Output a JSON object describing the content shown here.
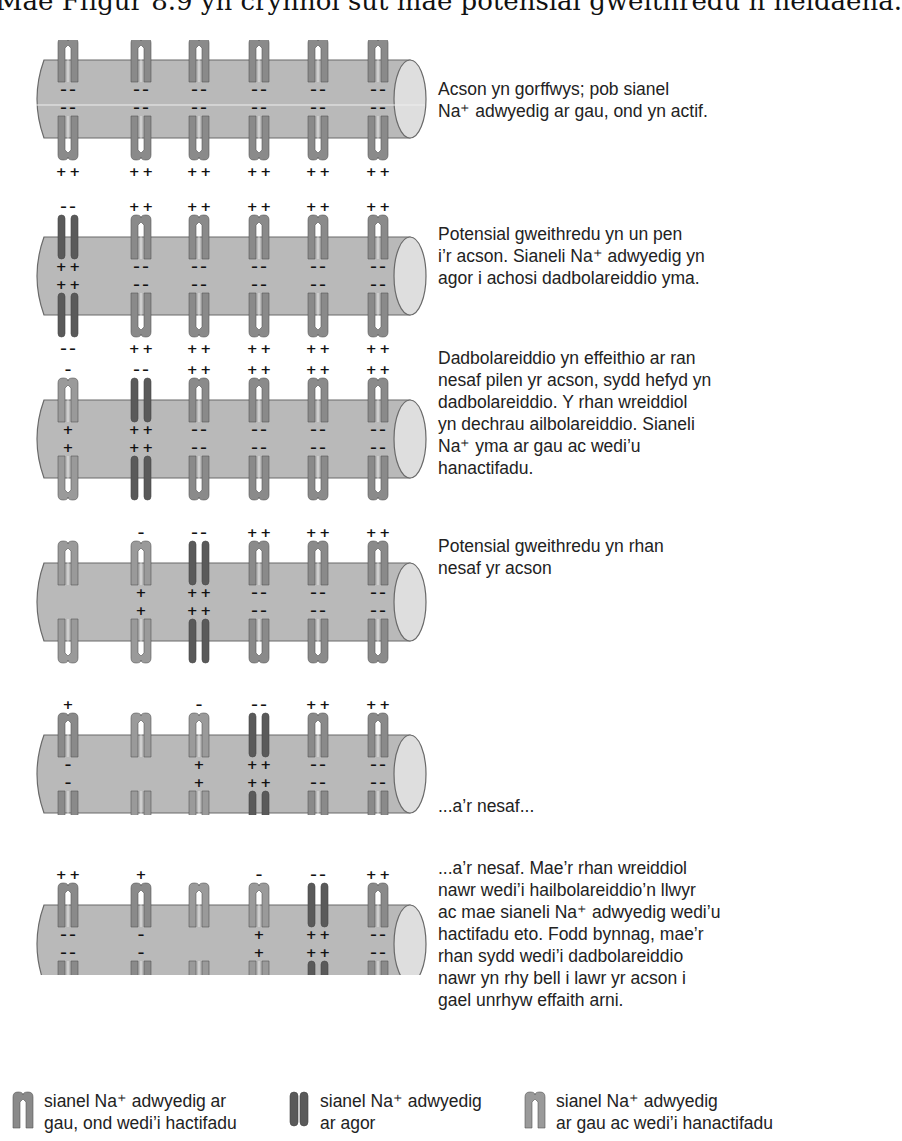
{
  "title": "Mae Ffigur 8.9 yn crynhoi sut mae potensial gweithredu n neidaena.",
  "colors": {
    "axon_fill": "#b9b9b9",
    "axon_end": "#dedede",
    "axon_outline": "#6a6a6a",
    "channel_closed_active": "#8a8a8a",
    "channel_open": "#5a5a5a",
    "channel_inactivated": "#9a9a9a"
  },
  "panels": [
    {
      "caption_lines": [
        "Acson yn gorffwys; pob sianel",
        "Na⁺ adwyedig ar gau, ond yn actif."
      ],
      "channels": [
        {
          "state": "closed",
          "top_out": "+ +",
          "top_in": "– –",
          "bot_in": "– –",
          "bot_out": "+ +"
        },
        {
          "state": "closed",
          "top_out": "+ +",
          "top_in": "– –",
          "bot_in": "– –",
          "bot_out": "+ +"
        },
        {
          "state": "closed",
          "top_out": "+ +",
          "top_in": "– –",
          "bot_in": "– –",
          "bot_out": "+ +"
        },
        {
          "state": "closed",
          "top_out": "+ +",
          "top_in": "– –",
          "bot_in": "– –",
          "bot_out": "+ +"
        },
        {
          "state": "closed",
          "top_out": "+ +",
          "top_in": "– –",
          "bot_in": "– –",
          "bot_out": "+ +"
        },
        {
          "state": "closed",
          "top_out": "+ +",
          "top_in": "– –",
          "bot_in": "– –",
          "bot_out": "+ +"
        }
      ]
    },
    {
      "caption_lines": [
        "Potensial gweithredu yn un pen",
        "i’r acson. Sianeli Na⁺ adwyedig yn",
        "agor i achosi dadbolareiddio yma."
      ],
      "channels": [
        {
          "state": "open",
          "top_out": "– –",
          "top_in": "+ +",
          "bot_in": "+ +",
          "bot_out": "– –"
        },
        {
          "state": "closed",
          "top_out": "+ +",
          "top_in": "– –",
          "bot_in": "– –",
          "bot_out": "+ +"
        },
        {
          "state": "closed",
          "top_out": "+ +",
          "top_in": "– –",
          "bot_in": "– –",
          "bot_out": "+ +"
        },
        {
          "state": "closed",
          "top_out": "+ +",
          "top_in": "– –",
          "bot_in": "– –",
          "bot_out": "+ +"
        },
        {
          "state": "closed",
          "top_out": "+ +",
          "top_in": "– –",
          "bot_in": "– –",
          "bot_out": "+ +"
        },
        {
          "state": "closed",
          "top_out": "+ +",
          "top_in": "– –",
          "bot_in": "– –",
          "bot_out": "+ +"
        }
      ]
    },
    {
      "caption_lines": [
        "Dadbolareiddio yn effeithio ar ran",
        "nesaf pilen yr acson, sydd hefyd yn",
        "dadbolareiddio. Y rhan wreiddiol",
        "yn dechrau ailbolareiddio. Sianeli",
        "Na⁺ yma ar gau ac wedi’u",
        "hanactifadu."
      ],
      "channels": [
        {
          "state": "inactivated",
          "top_out": "–",
          "top_in": "+",
          "bot_in": "+",
          "bot_out": "–"
        },
        {
          "state": "open",
          "top_out": "– –",
          "top_in": "+ +",
          "bot_in": "+ +",
          "bot_out": "– –"
        },
        {
          "state": "closed",
          "top_out": "+ +",
          "top_in": "– –",
          "bot_in": "– –",
          "bot_out": "+ +"
        },
        {
          "state": "closed",
          "top_out": "+ +",
          "top_in": "– –",
          "bot_in": "– –",
          "bot_out": "+ +"
        },
        {
          "state": "closed",
          "top_out": "+ +",
          "top_in": "– –",
          "bot_in": "– –",
          "bot_out": "+ +"
        },
        {
          "state": "closed",
          "top_out": "+ +",
          "top_in": "– –",
          "bot_in": "– –",
          "bot_out": "+ +"
        }
      ]
    },
    {
      "caption_lines": [
        "Potensial gweithredu yn rhan",
        "nesaf yr acson"
      ],
      "channels": [
        {
          "state": "inactivated",
          "top_out": "",
          "top_in": "",
          "bot_in": "",
          "bot_out": ""
        },
        {
          "state": "inactivated",
          "top_out": "–",
          "top_in": "+",
          "bot_in": "+",
          "bot_out": "–"
        },
        {
          "state": "open",
          "top_out": "– –",
          "top_in": "+ +",
          "bot_in": "+ +",
          "bot_out": "– –"
        },
        {
          "state": "closed",
          "top_out": "+ +",
          "top_in": "– –",
          "bot_in": "– –",
          "bot_out": "+ +"
        },
        {
          "state": "closed",
          "top_out": "+ +",
          "top_in": "– –",
          "bot_in": "– –",
          "bot_out": "+ +"
        },
        {
          "state": "closed",
          "top_out": "+ +",
          "top_in": "– –",
          "bot_in": "– –",
          "bot_out": "+ +"
        }
      ]
    },
    {
      "caption_lines": [
        "...a’r nesaf..."
      ],
      "channels": [
        {
          "state": "closed",
          "top_out": "+",
          "top_in": "–",
          "bot_in": "–",
          "bot_out": "+"
        },
        {
          "state": "inactivated",
          "top_out": "",
          "top_in": "",
          "bot_in": "",
          "bot_out": ""
        },
        {
          "state": "inactivated",
          "top_out": "–",
          "top_in": "+",
          "bot_in": "+",
          "bot_out": "–"
        },
        {
          "state": "open",
          "top_out": "– –",
          "top_in": "+ +",
          "bot_in": "+ +",
          "bot_out": "– –"
        },
        {
          "state": "closed",
          "top_out": "+ +",
          "top_in": "– –",
          "bot_in": "– –",
          "bot_out": "+ +"
        },
        {
          "state": "closed",
          "top_out": "+ +",
          "top_in": "– –",
          "bot_in": "– –",
          "bot_out": "+ +"
        }
      ]
    },
    {
      "caption_lines": [
        "...a’r nesaf. Mae’r rhan wreiddiol",
        "nawr wedi’i hailbolareiddio’n llwyr",
        "ac mae sianeli Na⁺ adwyedig wedi’u",
        "hactifadu eto. Fodd bynnag, mae’r",
        "rhan sydd wedi’i dadbolareiddio",
        "nawr yn rhy bell i lawr yr acson i",
        "gael unrhyw effaith arni."
      ],
      "channels": [
        {
          "state": "closed",
          "top_out": "+ +",
          "top_in": "– –",
          "bot_in": "– –",
          "bot_out": "+ +"
        },
        {
          "state": "closed",
          "top_out": "+",
          "top_in": "–",
          "bot_in": "–",
          "bot_out": "+"
        },
        {
          "state": "inactivated",
          "top_out": "",
          "top_in": "",
          "bot_in": "",
          "bot_out": ""
        },
        {
          "state": "inactivated",
          "top_out": "–",
          "top_in": "+",
          "bot_in": "+",
          "bot_out": "–"
        },
        {
          "state": "open",
          "top_out": "– –",
          "top_in": "+ +",
          "bot_in": "+ +",
          "bot_out": "– –"
        },
        {
          "state": "closed",
          "top_out": "+ +",
          "top_in": "– –",
          "bot_in": "– –",
          "bot_out": "+ +"
        }
      ]
    }
  ],
  "legend": [
    {
      "state": "closed",
      "line1": "sianel Na⁺ adwyedig ar",
      "line2": "gau, ond wedi’i hactifadu"
    },
    {
      "state": "open",
      "line1": "sianel Na⁺ adwyedig",
      "line2": "ar agor"
    },
    {
      "state": "inactivated",
      "line1": "sianel Na⁺ adwyedig",
      "line2": "ar gau ac wedi’i hanactifadu"
    }
  ]
}
